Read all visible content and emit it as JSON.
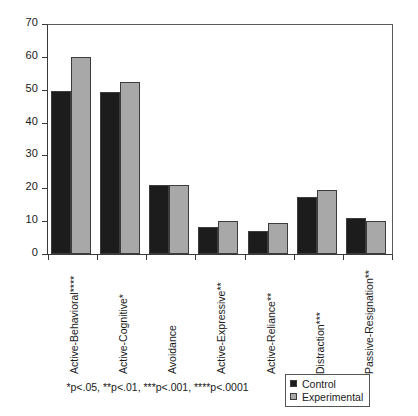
{
  "chart_data": {
    "type": "bar",
    "title": "",
    "xlabel": "",
    "ylabel": "",
    "ylim": [
      0,
      70
    ],
    "ytick_step": 10,
    "yticks": [
      "70",
      "60",
      "50",
      "40",
      "30",
      "20",
      "10",
      "0"
    ],
    "grid": false,
    "legend_position": "bottom-right",
    "categories": [
      "Active-Behavioral****",
      "Active-Cognitive*",
      "Avoidance",
      "Active-Expressive**",
      "Active-Reliance**",
      "Distraction***",
      "Passive-Resignation**"
    ],
    "series": [
      {
        "name": "Control",
        "color": "#1c1c1c",
        "values": [
          49.5,
          49.3,
          21.0,
          8.2,
          7.0,
          17.3,
          11.0
        ]
      },
      {
        "name": "Experimental",
        "color": "#a8a8a8",
        "values": [
          60.0,
          52.3,
          21.1,
          10.2,
          9.3,
          19.5,
          10.0
        ]
      }
    ],
    "annotations": [
      "*p<.05, **p<.01, ***p<.001, ****p<.0001"
    ]
  },
  "footnote": {
    "text": "*p<.05, **p<.01, ***p<.001, ****p<.0001"
  },
  "legend": {
    "items": [
      {
        "label": "Control"
      },
      {
        "label": "Experimental"
      }
    ]
  }
}
